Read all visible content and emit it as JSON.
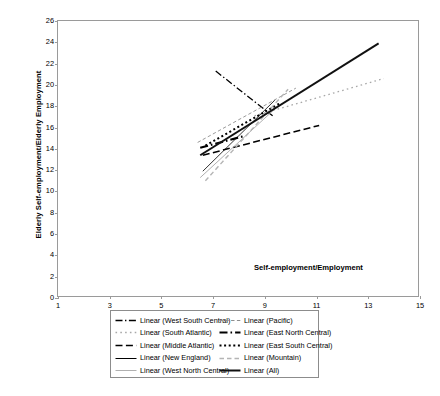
{
  "chart_data": {
    "type": "line",
    "title": "",
    "xlabel": "Self-employment/Employment",
    "ylabel": "Elderly Self-employment/Elderly Employment",
    "xlim": [
      1,
      15
    ],
    "ylim": [
      0,
      26
    ],
    "xticks": [
      1,
      3,
      5,
      7,
      9,
      11,
      13,
      15
    ],
    "yticks": [
      0,
      2,
      4,
      6,
      8,
      10,
      12,
      14,
      16,
      18,
      20,
      22,
      24,
      26
    ],
    "grid": false,
    "legend_position": "below-plot",
    "legend_columns": 2,
    "series": [
      {
        "name": "Linear (West South Central)",
        "style": "dash-dot",
        "color": "#000000",
        "width": 1.3,
        "x": [
          7.1,
          9.3
        ],
        "y": [
          21.3,
          17.1
        ]
      },
      {
        "name": "Linear (South Atlantic)",
        "style": "dotted-sparse",
        "color": "#a8a8a8",
        "width": 1.3,
        "x": [
          8.6,
          13.6
        ],
        "y": [
          17.1,
          20.6
        ]
      },
      {
        "name": "Linear (Middle Atlantic)",
        "style": "dashed",
        "color": "#000000",
        "width": 1.6,
        "x": [
          6.6,
          11.1
        ],
        "y": [
          13.4,
          16.2
        ]
      },
      {
        "name": "Linear (New England)",
        "style": "solid-thin",
        "color": "#000000",
        "width": 0.8,
        "x": [
          6.6,
          9.4
        ],
        "y": [
          11.9,
          18.6
        ]
      },
      {
        "name": "Linear (West North Central)",
        "style": "solid-thin",
        "color": "#b0b0b0",
        "width": 1.0,
        "x": [
          6.5,
          9.5
        ],
        "y": [
          11.3,
          18.0
        ]
      },
      {
        "name": "Linear (Pacific)",
        "style": "dashed-fine",
        "color": "#8e8e8e",
        "width": 0.9,
        "x": [
          6.4,
          10.2
        ],
        "y": [
          14.6,
          19.7
        ]
      },
      {
        "name": "Linear (East North Central)",
        "style": "dash-dot-thick",
        "color": "#000000",
        "width": 2.2,
        "x": [
          6.5,
          8.2
        ],
        "y": [
          14.1,
          15.2
        ]
      },
      {
        "name": "Linear (East South Central)",
        "style": "dotted-thick",
        "color": "#000000",
        "width": 2.0,
        "x": [
          6.7,
          9.6
        ],
        "y": [
          14.3,
          18.3
        ]
      },
      {
        "name": "Linear (Mountain)",
        "style": "dashed-grey",
        "color": "#b4b4b4",
        "width": 1.4,
        "x": [
          6.7,
          9.9
        ],
        "y": [
          11.0,
          19.6
        ]
      },
      {
        "name": "Linear (All)",
        "style": "solid-thick",
        "color": "#111111",
        "width": 2.0,
        "x": [
          6.5,
          13.4
        ],
        "y": [
          13.4,
          23.9
        ]
      }
    ]
  },
  "legend": {
    "items": [
      {
        "label": "Linear (West South Central)",
        "key": "west-south-central"
      },
      {
        "label": "Linear (Pacific)",
        "key": "pacific"
      },
      {
        "label": "Linear (South Atlantic)",
        "key": "south-atlantic"
      },
      {
        "label": "Linear (East North Central)",
        "key": "east-north-central"
      },
      {
        "label": "Linear (Middle Atlantic)",
        "key": "middle-atlantic"
      },
      {
        "label": "Linear (East South Central)",
        "key": "east-south-central"
      },
      {
        "label": "Linear (New England)",
        "key": "new-england"
      },
      {
        "label": "Linear (Mountain)",
        "key": "mountain"
      },
      {
        "label": "Linear (West North Central)",
        "key": "west-north-central"
      },
      {
        "label": "Linear (All)",
        "key": "all"
      }
    ]
  }
}
